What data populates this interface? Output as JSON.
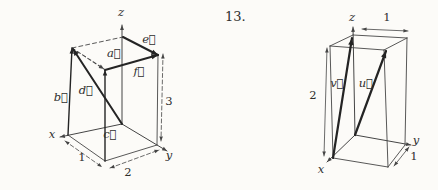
{
  "page": {
    "width": 438,
    "height": 190,
    "background": "#fcfbf8",
    "ink": "#454545",
    "vector_ink": "#242424",
    "text_ink": "#2e2e2e"
  },
  "exercise_number": "13.",
  "figures": [
    {
      "name": "box-1x2x3-vectors-figure",
      "lines": [
        {
          "name": "z-axis",
          "x1": 122,
          "y1": 124,
          "x2": 122,
          "y2": 25,
          "w": 1,
          "arrow": "end"
        },
        {
          "name": "x-axis",
          "x1": 122,
          "y1": 124,
          "x2": 60,
          "y2": 137,
          "w": 1,
          "arrow": "end"
        },
        {
          "name": "y-axis",
          "x1": 122,
          "y1": 124,
          "x2": 167,
          "y2": 151,
          "w": 1,
          "arrow": "end"
        },
        {
          "name": "edge-bottom-left-front",
          "x1": 68,
          "y1": 135,
          "x2": 105,
          "y2": 161,
          "w": 0.9
        },
        {
          "name": "edge-bottom-front-right",
          "x1": 105,
          "y1": 161,
          "x2": 157,
          "y2": 145,
          "w": 0.9
        },
        {
          "name": "edge-right-vertical",
          "x1": 157,
          "y1": 145,
          "x2": 158,
          "y2": 55,
          "w": 0.9
        },
        {
          "name": "edge-top-back-left",
          "x1": 72,
          "y1": 48,
          "x2": 123,
          "y2": 37,
          "w": 0.9,
          "dash": "4 3"
        },
        {
          "name": "vector-b-line",
          "x1": 68,
          "y1": 135,
          "x2": 72,
          "y2": 48,
          "w": 1.4,
          "arrow": "end"
        },
        {
          "name": "vector-c-line",
          "x1": 105,
          "y1": 161,
          "x2": 105,
          "y2": 70,
          "w": 1.4,
          "arrow": "end"
        },
        {
          "name": "vector-a-line",
          "x1": 72,
          "y1": 48,
          "x2": 104,
          "y2": 69,
          "w": 1.1,
          "dash": "3.5 2.8",
          "arrow": "end"
        },
        {
          "name": "vector-d-line",
          "x1": 122,
          "y1": 124,
          "x2": 73,
          "y2": 49,
          "w": 2,
          "arrow": "end"
        },
        {
          "name": "vector-e-line",
          "x1": 123,
          "y1": 37,
          "x2": 158,
          "y2": 55,
          "w": 2,
          "arrow": "end"
        },
        {
          "name": "vector-f-line",
          "x1": 105,
          "y1": 70,
          "x2": 158,
          "y2": 55,
          "w": 2,
          "arrow": "end"
        },
        {
          "name": "dim-1-line",
          "x1": 65,
          "y1": 141,
          "x2": 102,
          "y2": 167,
          "w": 0.8,
          "dash": "4 2.5",
          "arrow": "both"
        },
        {
          "name": "dim-2-line",
          "x1": 110,
          "y1": 168,
          "x2": 159,
          "y2": 150,
          "w": 0.8,
          "dash": "4 2.5",
          "arrow": "both"
        },
        {
          "name": "dim-3-line",
          "x1": 163,
          "y1": 54,
          "x2": 161,
          "y2": 141,
          "w": 0.8,
          "dash": "4 2.5",
          "arrow": "both"
        }
      ],
      "labels": [
        {
          "name": "axis-label-z",
          "text": "z",
          "x": 121,
          "y": 12,
          "italic": true
        },
        {
          "name": "axis-label-x",
          "text": "x",
          "x": 52,
          "y": 134,
          "italic": true
        },
        {
          "name": "axis-label-y",
          "text": "y",
          "x": 169,
          "y": 155,
          "italic": true
        },
        {
          "name": "vector-label-a",
          "text": "a⃗",
          "x": 114,
          "y": 53,
          "italic": true
        },
        {
          "name": "vector-label-b",
          "text": "b⃗",
          "x": 61,
          "y": 97,
          "italic": true
        },
        {
          "name": "vector-label-c",
          "text": "c⃗",
          "x": 110,
          "y": 134,
          "italic": true
        },
        {
          "name": "vector-label-d",
          "text": "d⃗",
          "x": 86,
          "y": 90,
          "italic": true
        },
        {
          "name": "vector-label-e",
          "text": "e⃗",
          "x": 149,
          "y": 39,
          "italic": true
        },
        {
          "name": "vector-label-f",
          "text": "f⃗",
          "x": 139,
          "y": 71,
          "italic": true
        },
        {
          "name": "dim-1-label",
          "text": "1",
          "x": 82,
          "y": 157
        },
        {
          "name": "dim-2-label",
          "text": "2",
          "x": 128,
          "y": 172
        },
        {
          "name": "dim-3-label",
          "text": "3",
          "x": 169,
          "y": 101
        }
      ]
    },
    {
      "name": "box-1x1x2-vectors-figure",
      "lines": [
        {
          "name": "z-axis",
          "x1": 355,
          "y1": 135,
          "x2": 353,
          "y2": 27,
          "w": 1,
          "arrow": "end"
        },
        {
          "name": "x-axis",
          "x1": 355,
          "y1": 135,
          "x2": 327,
          "y2": 162,
          "w": 1,
          "arrow": "end"
        },
        {
          "name": "y-axis",
          "x1": 355,
          "y1": 135,
          "x2": 411,
          "y2": 145,
          "w": 1,
          "arrow": "end"
        },
        {
          "name": "edge-bottom-left-front",
          "x1": 333,
          "y1": 158,
          "x2": 388,
          "y2": 167,
          "w": 0.9
        },
        {
          "name": "edge-bottom-front-right",
          "x1": 388,
          "y1": 167,
          "x2": 405,
          "y2": 145,
          "w": 0.9
        },
        {
          "name": "edge-left-vertical",
          "x1": 333,
          "y1": 158,
          "x2": 330,
          "y2": 46,
          "w": 0.9
        },
        {
          "name": "edge-front-vertical",
          "x1": 388,
          "y1": 167,
          "x2": 384,
          "y2": 50,
          "w": 0.9
        },
        {
          "name": "edge-right-vertical",
          "x1": 405,
          "y1": 145,
          "x2": 407,
          "y2": 38,
          "w": 0.9
        },
        {
          "name": "edge-top-left-back",
          "x1": 330,
          "y1": 46,
          "x2": 353,
          "y2": 35,
          "w": 0.9
        },
        {
          "name": "edge-top-back-right",
          "x1": 353,
          "y1": 35,
          "x2": 407,
          "y2": 38,
          "w": 0.9
        },
        {
          "name": "edge-top-left-front",
          "x1": 330,
          "y1": 46,
          "x2": 384,
          "y2": 50,
          "w": 0.9
        },
        {
          "name": "edge-top-front-right",
          "x1": 384,
          "y1": 50,
          "x2": 407,
          "y2": 38,
          "w": 0.9
        },
        {
          "name": "vector-v-line",
          "x1": 333,
          "y1": 158,
          "x2": 352,
          "y2": 38,
          "w": 2.2,
          "arrow": "end"
        },
        {
          "name": "vector-u-line",
          "x1": 355,
          "y1": 135,
          "x2": 386,
          "y2": 51,
          "w": 2.2,
          "arrow": "end"
        },
        {
          "name": "dim-2-line",
          "x1": 327,
          "y1": 48,
          "x2": 324,
          "y2": 156,
          "w": 0.8,
          "arrow": "both"
        },
        {
          "name": "dim-1-top-line",
          "x1": 362,
          "y1": 29,
          "x2": 408,
          "y2": 31,
          "w": 0.8,
          "arrow": "both"
        },
        {
          "name": "dim-1-right-line",
          "x1": 409,
          "y1": 147,
          "x2": 394,
          "y2": 166,
          "w": 0.8,
          "arrow": "both"
        }
      ],
      "labels": [
        {
          "name": "axis-label-z",
          "text": "z",
          "x": 352,
          "y": 17,
          "italic": true
        },
        {
          "name": "axis-label-x",
          "text": "x",
          "x": 321,
          "y": 169,
          "italic": true
        },
        {
          "name": "axis-label-y",
          "text": "y",
          "x": 416,
          "y": 140,
          "italic": true
        },
        {
          "name": "vector-label-v",
          "text": "v⃗",
          "x": 337,
          "y": 83,
          "italic": true
        },
        {
          "name": "vector-label-u",
          "text": "u⃗",
          "x": 366,
          "y": 83,
          "italic": true
        },
        {
          "name": "dim-2-label",
          "text": "2",
          "x": 313,
          "y": 95
        },
        {
          "name": "dim-1-top-label",
          "text": "1",
          "x": 387,
          "y": 17
        },
        {
          "name": "dim-1-right-label",
          "text": "1",
          "x": 414,
          "y": 156
        }
      ]
    }
  ]
}
